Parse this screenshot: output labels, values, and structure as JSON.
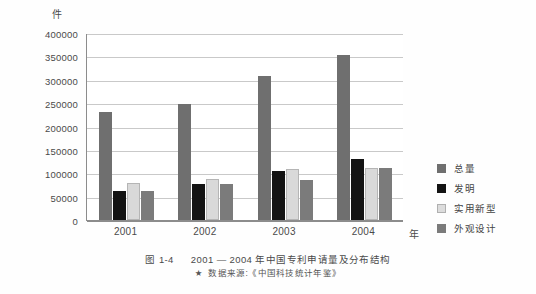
{
  "chart_data": {
    "type": "bar",
    "title": "",
    "unit_label": "件",
    "xlabel": "年",
    "ylabel": "",
    "categories": [
      "2001",
      "2002",
      "2003",
      "2004"
    ],
    "ylim": [
      0,
      400000
    ],
    "ytick_step": 50000,
    "yticks": [
      "0",
      "50000",
      "100000",
      "150000",
      "200000",
      "250000",
      "300000",
      "350000",
      "400000"
    ],
    "grid": true,
    "legend_position": "right",
    "series": [
      {
        "name": "总量",
        "color": "#6f6f6f",
        "values": [
          230000,
          248000,
          308000,
          353000
        ]
      },
      {
        "name": "发明",
        "color": "#131313",
        "values": [
          63000,
          78000,
          105000,
          130000
        ]
      },
      {
        "name": "实用新型",
        "color": "#d9d9d9",
        "values": [
          79000,
          87000,
          109000,
          112000
        ]
      },
      {
        "name": "外观设计",
        "color": "#7b7b7b",
        "values": [
          62000,
          78000,
          86000,
          112000
        ]
      }
    ]
  },
  "caption": {
    "figure_number": "图 1-4",
    "text": "2001 — 2004 年中国专利申请量及分布结构"
  },
  "source": {
    "star": "★",
    "text": "数据来源:《中国科技统计年鉴》"
  }
}
